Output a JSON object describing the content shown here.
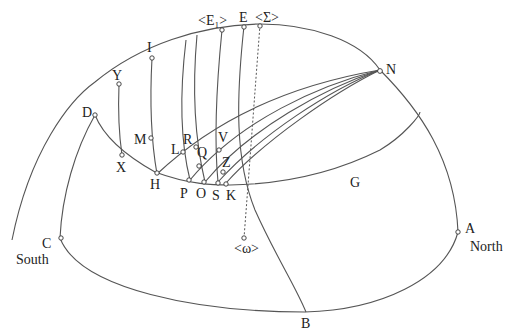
{
  "diagram": {
    "type": "celestial-sphere-projection",
    "labels": {
      "E_sub": "<E₁>",
      "E": "E",
      "Sigma": "<Σ>",
      "I": "I",
      "Y": "Y",
      "D": "D",
      "M": "M",
      "X": "X",
      "R": "R",
      "L": "L",
      "Q": "Q",
      "V": "V",
      "H": "H",
      "P": "P",
      "O": "O",
      "S": "S",
      "Z": "Z",
      "K": "K",
      "G": "G",
      "N": "N",
      "omega": "<ω>",
      "C": "C",
      "South": "South",
      "A": "A",
      "North": "North",
      "B": "B"
    },
    "points": [
      "E1",
      "E",
      "Sigma",
      "I",
      "Y",
      "D",
      "M",
      "X",
      "R",
      "L",
      "Q",
      "V",
      "H",
      "P",
      "O",
      "S",
      "Z",
      "K",
      "N",
      "omega",
      "C",
      "A"
    ],
    "colors": {
      "stroke": "#555555",
      "text": "#222222",
      "background": "#ffffff"
    }
  }
}
